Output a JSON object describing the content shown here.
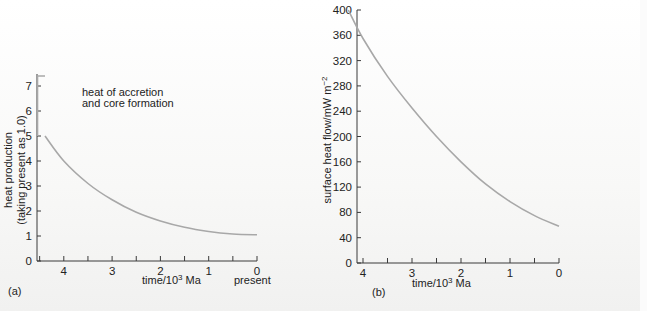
{
  "chart_data": [
    {
      "panel": "(a)",
      "type": "line",
      "title": "",
      "xlabel": "time/10^3 Ma",
      "xlabel_parts": {
        "base": "time/10",
        "sup": "3",
        "tail": " Ma"
      },
      "ylabel": "heat production (taking present as 1.0)",
      "ylabel_lines": [
        "heat production",
        "(taking present as 1.0)"
      ],
      "x_ticks": [
        4,
        3,
        2,
        1,
        0
      ],
      "x_minor_ticks": [
        4.5,
        3.5,
        2.5,
        1.5,
        0.5
      ],
      "x_extra_label": "present",
      "y_ticks": [
        0,
        1,
        2,
        3,
        4,
        5,
        6,
        7
      ],
      "xlim": [
        4.55,
        0
      ],
      "ylim": [
        0,
        7.4
      ],
      "annotation": [
        "heat of accretion",
        "and core formation"
      ],
      "grid": false,
      "series": [
        {
          "name": "heat of accretion and core formation",
          "x": [
            4.55,
            4.55,
            4.45,
            4.45
          ],
          "values": [
            5.0,
            7.4,
            7.4,
            7.4
          ]
        },
        {
          "name": "radiogenic heat production",
          "x": [
            4.45,
            4.0,
            3.5,
            3.0,
            2.5,
            2.0,
            1.5,
            1.0,
            0.5,
            0.0
          ],
          "values": [
            5.0,
            4.0,
            3.1,
            2.45,
            1.95,
            1.6,
            1.35,
            1.18,
            1.08,
            1.05
          ]
        }
      ]
    },
    {
      "panel": "(b)",
      "type": "line",
      "title": "",
      "xlabel": "time/10^3 Ma",
      "xlabel_parts": {
        "base": "time/10",
        "sup": "3",
        "tail": " Ma"
      },
      "ylabel": "surface heat flow/mW m^-2",
      "ylabel_parts": {
        "base": "surface heat flow/mW m",
        "sup": "−2"
      },
      "x_ticks": [
        4,
        3,
        2,
        1,
        0
      ],
      "x_minor_ticks": [
        4.5,
        3.5,
        2.5,
        1.5,
        0.5
      ],
      "y_ticks": [
        0,
        40,
        80,
        120,
        160,
        200,
        240,
        280,
        320,
        360,
        400
      ],
      "xlim": [
        4.5,
        0
      ],
      "ylim": [
        0,
        400
      ],
      "grid": false,
      "series": [
        {
          "name": "surface heat flow",
          "x": [
            4.3,
            4.0,
            3.5,
            3.0,
            2.5,
            2.0,
            1.5,
            1.0,
            0.5,
            0.0
          ],
          "values": [
            400,
            355,
            295,
            245,
            200,
            160,
            125,
            97,
            75,
            58
          ]
        }
      ]
    }
  ],
  "panels": {
    "a": {
      "label": "(a)",
      "present": "present"
    },
    "b": {
      "label": "(b)"
    }
  },
  "colors": {
    "curve": "#a8a8a8",
    "axis": "#3a3a3a",
    "text": "#222222"
  }
}
